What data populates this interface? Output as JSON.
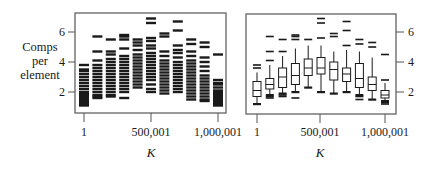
{
  "chart_data": [
    {
      "type": "strip",
      "panel": "left",
      "title": "",
      "xlabel": "K",
      "ylabel": "Comps per element",
      "x_ticks": [
        "1",
        "500,001",
        "1,000,001"
      ],
      "y_ticks": [
        2,
        4,
        6
      ],
      "ylim": [
        1,
        7.3
      ],
      "groups": 11,
      "series": [
        {
          "name": "g1",
          "values": [
            1.1,
            1.2,
            1.3,
            1.4,
            1.5,
            1.6,
            1.7,
            1.8,
            1.9,
            2.0,
            2.2,
            2.4,
            2.6,
            2.8,
            3.0,
            3.2,
            3.4,
            3.5,
            3.8
          ]
        },
        {
          "name": "g2",
          "values": [
            1.6,
            1.7,
            1.8,
            2.0,
            2.2,
            2.4,
            2.6,
            2.8,
            3.0,
            3.2,
            3.4,
            3.6,
            3.8,
            4.1,
            4.7,
            5.7
          ]
        },
        {
          "name": "g3",
          "values": [
            1.7,
            1.8,
            2.0,
            2.2,
            2.4,
            2.6,
            2.8,
            3.0,
            3.2,
            3.4,
            3.6,
            3.8,
            4.0,
            4.2,
            4.5,
            4.7,
            5.5
          ]
        },
        {
          "name": "g4",
          "values": [
            1.6,
            2.0,
            2.2,
            2.4,
            2.6,
            2.8,
            3.0,
            3.2,
            3.4,
            3.6,
            3.8,
            4.0,
            4.2,
            4.4,
            4.9,
            5.5,
            5.7,
            5.8
          ]
        },
        {
          "name": "g5",
          "values": [
            2.3,
            2.5,
            2.7,
            2.9,
            3.1,
            3.3,
            3.5,
            3.7,
            3.9,
            4.1,
            4.3,
            4.5,
            4.8,
            5.1,
            5.3,
            5.5
          ]
        },
        {
          "name": "g6",
          "values": [
            2.0,
            2.2,
            2.5,
            2.8,
            3.0,
            3.2,
            3.4,
            3.6,
            3.8,
            4.0,
            4.2,
            4.4,
            4.6,
            4.9,
            5.1,
            5.4,
            5.6,
            6.6,
            6.9
          ]
        },
        {
          "name": "g7",
          "values": [
            1.9,
            2.1,
            2.3,
            2.5,
            2.7,
            2.9,
            3.1,
            3.3,
            3.5,
            3.7,
            3.9,
            4.1,
            4.4,
            4.7,
            5.7,
            5.9
          ]
        },
        {
          "name": "g8",
          "values": [
            2.0,
            2.2,
            2.4,
            2.6,
            2.8,
            3.0,
            3.2,
            3.4,
            3.6,
            3.8,
            4.0,
            4.3,
            4.6,
            4.8,
            5.1,
            6.1,
            6.7
          ]
        },
        {
          "name": "g9",
          "values": [
            1.5,
            1.7,
            1.9,
            2.1,
            2.3,
            2.5,
            2.7,
            2.9,
            3.1,
            3.3,
            3.5,
            3.7,
            3.9,
            4.1,
            4.4,
            4.7,
            5.2,
            5.5
          ]
        },
        {
          "name": "g10",
          "values": [
            1.4,
            1.5,
            1.7,
            1.9,
            2.1,
            2.3,
            2.5,
            2.7,
            2.9,
            3.1,
            3.4,
            3.7,
            4.0,
            4.3,
            5.0,
            5.3
          ]
        },
        {
          "name": "g11",
          "values": [
            1.1,
            1.2,
            1.3,
            1.4,
            1.5,
            1.6,
            1.7,
            1.8,
            1.9,
            2.0,
            2.1,
            2.3,
            2.5,
            2.6,
            2.8,
            4.5
          ]
        }
      ]
    },
    {
      "type": "box",
      "panel": "right",
      "title": "",
      "xlabel": "K",
      "ylabel": "",
      "x_ticks": [
        "1",
        "500,001",
        "1,000,001"
      ],
      "y_ticks": [
        2,
        4,
        6
      ],
      "ylim": [
        1,
        7.3
      ],
      "boxes": [
        {
          "min": 1.2,
          "q1": 1.7,
          "median": 2.1,
          "q3": 2.7,
          "max": 3.3,
          "outliers": [
            1.2,
            3.6,
            3.8
          ]
        },
        {
          "min": 1.8,
          "q1": 2.2,
          "median": 2.5,
          "q3": 2.9,
          "max": 3.8,
          "outliers": [
            1.6,
            1.7,
            4.1,
            4.7,
            5.7
          ]
        },
        {
          "min": 1.9,
          "q1": 2.3,
          "median": 3.0,
          "q3": 3.6,
          "max": 4.4,
          "outliers": [
            1.7,
            1.8,
            4.7,
            5.5
          ]
        },
        {
          "min": 2.0,
          "q1": 2.5,
          "median": 3.1,
          "q3": 3.9,
          "max": 4.9,
          "outliers": [
            1.6,
            5.5,
            5.7,
            5.8
          ]
        },
        {
          "min": 2.3,
          "q1": 3.1,
          "median": 3.6,
          "q3": 4.2,
          "max": 5.1,
          "outliers": [
            5.5
          ]
        },
        {
          "min": 2.0,
          "q1": 3.2,
          "median": 3.6,
          "q3": 4.3,
          "max": 5.1,
          "outliers": [
            5.6,
            6.6,
            6.9
          ]
        },
        {
          "min": 1.9,
          "q1": 2.8,
          "median": 3.5,
          "q3": 4.0,
          "max": 4.7,
          "outliers": [
            5.7,
            5.9
          ]
        },
        {
          "min": 2.0,
          "q1": 2.7,
          "median": 3.2,
          "q3": 3.6,
          "max": 4.8,
          "outliers": [
            5.1,
            6.1,
            6.7
          ]
        },
        {
          "min": 1.8,
          "q1": 2.3,
          "median": 2.9,
          "q3": 3.9,
          "max": 4.7,
          "outliers": [
            1.5,
            1.7,
            5.2,
            5.5
          ]
        },
        {
          "min": 1.5,
          "q1": 2.1,
          "median": 2.5,
          "q3": 3.0,
          "max": 4.3,
          "outliers": [
            5.0,
            5.3
          ]
        },
        {
          "min": 1.4,
          "q1": 1.6,
          "median": 1.8,
          "q3": 2.1,
          "max": 2.6,
          "outliers": [
            1.2,
            1.3,
            2.8,
            4.5
          ]
        }
      ]
    }
  ],
  "labels": {
    "ylabel": "Comps per element",
    "ylabel_lines": [
      "Comps",
      "per",
      "element"
    ],
    "xlabel_left": "K",
    "xlabel_right": "K",
    "xticks": [
      "1",
      "500,001",
      "1,000,001"
    ],
    "yticks": [
      "2",
      "4",
      "6"
    ]
  },
  "colors": {
    "ink": "#1a1a1a",
    "frame": "#555555",
    "background": "#ffffff"
  }
}
